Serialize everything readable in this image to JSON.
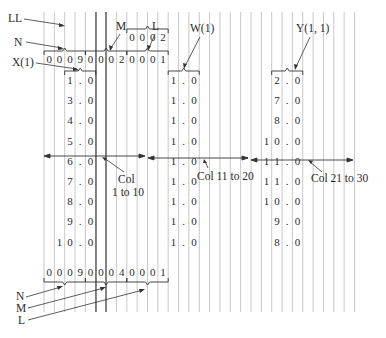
{
  "diagram": {
    "labels": {
      "LL": "LL",
      "N": "N",
      "X": "X(1)",
      "M": "M",
      "L": "L",
      "W": "W(1)",
      "Y": "Y(1, 1)",
      "N_bottom": "N",
      "M_bottom": "M",
      "L_bottom": "L"
    },
    "col_labels": {
      "c1": {
        "line1": "Col",
        "line2": "1  to  10"
      },
      "c2": {
        "line1": "Col  11  to  20"
      },
      "c3": {
        "line1": "Col  21  to  30"
      }
    },
    "ll_card": [
      "0",
      "0",
      "0",
      "2"
    ],
    "header_card": [
      "0",
      "0",
      "0",
      "9",
      "0",
      "0",
      "0",
      "2",
      "0",
      "0",
      "0",
      "1"
    ],
    "footer_card": [
      "0",
      "0",
      "0",
      "9",
      "0",
      "0",
      "0",
      "4",
      "0",
      "0",
      "0",
      "1"
    ],
    "x_values": [
      [
        "1",
        ".",
        "0"
      ],
      [
        "3",
        ".",
        "0"
      ],
      [
        "4",
        ".",
        "0"
      ],
      [
        "5",
        ".",
        "0"
      ],
      [
        "6",
        ".",
        "0"
      ],
      [
        "7",
        ".",
        "0"
      ],
      [
        "8",
        ".",
        "0"
      ],
      [
        "9",
        ".",
        "0"
      ],
      [
        "10",
        ".",
        "0"
      ]
    ],
    "w_values": [
      [
        "1",
        ".",
        "0"
      ],
      [
        "1",
        ".",
        "0"
      ],
      [
        "1",
        ".",
        "0"
      ],
      [
        "1",
        ".",
        "0"
      ],
      [
        "1",
        ".",
        "0"
      ],
      [
        "1",
        ".",
        "0"
      ],
      [
        "1",
        ".",
        "0"
      ],
      [
        "1",
        ".",
        "0"
      ],
      [
        "1",
        ".",
        "0"
      ]
    ],
    "y_values": [
      [
        "2",
        ".",
        "0"
      ],
      [
        "7",
        ".",
        "0"
      ],
      [
        "8",
        ".",
        "0"
      ],
      [
        "10",
        ".",
        "0"
      ],
      [
        "11",
        ".",
        "0"
      ],
      [
        "11",
        ".",
        "0"
      ],
      [
        "10",
        ".",
        "0"
      ],
      [
        "9",
        ".",
        "0"
      ],
      [
        "8",
        ".",
        "0"
      ]
    ],
    "colors": {
      "grid": "#c8c8c8",
      "dark_line": "#333333",
      "ink": "#2a2a2a"
    }
  }
}
